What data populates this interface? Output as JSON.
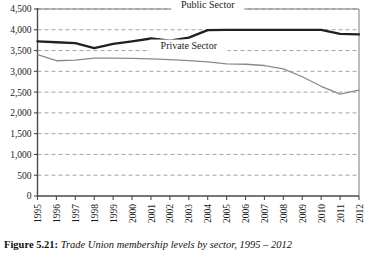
{
  "caption": {
    "label": "Figure 5.21:",
    "text": "Trade Union membership levels by sector, 1995 – 2012"
  },
  "chart_data": {
    "type": "line",
    "title": "",
    "xlabel": "",
    "ylabel": "",
    "ylim": [
      0,
      4500
    ],
    "ytick_step": 500,
    "grid": true,
    "grid_style": "dashed-horizontal",
    "legend_position": "inline-labels",
    "categories": [
      "1995",
      "1996",
      "1997",
      "1998",
      "1999",
      "2000",
      "2001",
      "2002",
      "2003",
      "2004",
      "2005",
      "2006",
      "2007",
      "2008",
      "2009",
      "2010",
      "2011",
      "2012"
    ],
    "yticks": [
      "0",
      "500",
      "1,000",
      "1,500",
      "2,000",
      "2,500",
      "3,000",
      "3,500",
      "4,000",
      "4,500"
    ],
    "series": [
      {
        "name": "Public Sector",
        "color": "#231f20",
        "values": [
          3720,
          3700,
          3680,
          3560,
          3660,
          3720,
          3790,
          3740,
          3810,
          3990,
          4000,
          4000,
          4000,
          4000,
          4000,
          4000,
          3900,
          3890
        ]
      },
      {
        "name": "Private Sector",
        "color": "#8a8a8a",
        "values": [
          3400,
          3255,
          3270,
          3320,
          3320,
          3310,
          3300,
          3280,
          3260,
          3230,
          3180,
          3170,
          3140,
          3060,
          2870,
          2640,
          2450,
          2550
        ]
      }
    ]
  }
}
